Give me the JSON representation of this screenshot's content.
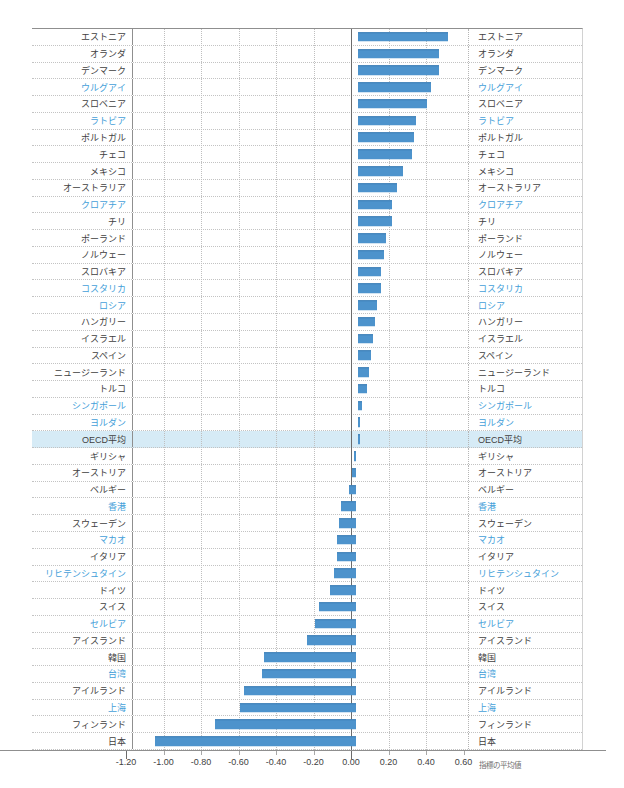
{
  "chart_data": {
    "type": "bar",
    "orientation": "horizontal",
    "xlabel": "指標の平均値",
    "xlim": [
      -1.2,
      0.6
    ],
    "grid": true,
    "x_ticks": [
      "-1.20",
      "-1.00",
      "-0.80",
      "-0.60",
      "-0.40",
      "-0.20",
      "0.00",
      "0.20",
      "0.40",
      "0.60"
    ],
    "x_tick_values": [
      -1.2,
      -1.0,
      -0.8,
      -0.6,
      -0.4,
      -0.2,
      0.0,
      0.2,
      0.4,
      0.6
    ],
    "bar_color": "#4d93cc",
    "member_label_color": "#3f3f3f",
    "partner_label_color": "#44a0d9",
    "highlight_row_color": "#d6ebf6",
    "entries": [
      {
        "label": "エストニア",
        "value": 0.48,
        "partner": false,
        "highlight": false
      },
      {
        "label": "オランダ",
        "value": 0.43,
        "partner": false,
        "highlight": false
      },
      {
        "label": "デンマーク",
        "value": 0.43,
        "partner": false,
        "highlight": false
      },
      {
        "label": "ウルグアイ",
        "value": 0.39,
        "partner": true,
        "highlight": false
      },
      {
        "label": "スロベニア",
        "value": 0.37,
        "partner": false,
        "highlight": false
      },
      {
        "label": "ラトビア",
        "value": 0.31,
        "partner": true,
        "highlight": false
      },
      {
        "label": "ポルトガル",
        "value": 0.3,
        "partner": false,
        "highlight": false
      },
      {
        "label": "チェコ",
        "value": 0.29,
        "partner": false,
        "highlight": false
      },
      {
        "label": "メキシコ",
        "value": 0.24,
        "partner": false,
        "highlight": false
      },
      {
        "label": "オーストラリア",
        "value": 0.21,
        "partner": false,
        "highlight": false
      },
      {
        "label": "クロアチア",
        "value": 0.18,
        "partner": true,
        "highlight": false
      },
      {
        "label": "チリ",
        "value": 0.18,
        "partner": false,
        "highlight": false
      },
      {
        "label": "ポーランド",
        "value": 0.15,
        "partner": false,
        "highlight": false
      },
      {
        "label": "ノルウェー",
        "value": 0.14,
        "partner": false,
        "highlight": false
      },
      {
        "label": "スロバキア",
        "value": 0.12,
        "partner": false,
        "highlight": false
      },
      {
        "label": "コスタリカ",
        "value": 0.12,
        "partner": true,
        "highlight": false
      },
      {
        "label": "ロシア",
        "value": 0.1,
        "partner": true,
        "highlight": false
      },
      {
        "label": "ハンガリー",
        "value": 0.09,
        "partner": false,
        "highlight": false
      },
      {
        "label": "イスラエル",
        "value": 0.08,
        "partner": false,
        "highlight": false
      },
      {
        "label": "スペイン",
        "value": 0.07,
        "partner": false,
        "highlight": false
      },
      {
        "label": "ニュージーランド",
        "value": 0.06,
        "partner": false,
        "highlight": false
      },
      {
        "label": "トルコ",
        "value": 0.05,
        "partner": false,
        "highlight": false
      },
      {
        "label": "シンガポール",
        "value": 0.02,
        "partner": true,
        "highlight": false
      },
      {
        "label": "ヨルダン",
        "value": 0.01,
        "partner": true,
        "highlight": false
      },
      {
        "label": "OECD平均",
        "value": 0.0,
        "partner": false,
        "highlight": true
      },
      {
        "label": "ギリシャ",
        "value": -0.01,
        "partner": false,
        "highlight": false
      },
      {
        "label": "オーストリア",
        "value": -0.02,
        "partner": false,
        "highlight": false
      },
      {
        "label": "ベルギー",
        "value": -0.04,
        "partner": false,
        "highlight": false
      },
      {
        "label": "香港",
        "value": -0.08,
        "partner": true,
        "highlight": false
      },
      {
        "label": "スウェーデン",
        "value": -0.09,
        "partner": false,
        "highlight": false
      },
      {
        "label": "マカオ",
        "value": -0.1,
        "partner": true,
        "highlight": false
      },
      {
        "label": "イタリア",
        "value": -0.1,
        "partner": false,
        "highlight": false
      },
      {
        "label": "リヒテンシュタイン",
        "value": -0.12,
        "partner": true,
        "highlight": false
      },
      {
        "label": "ドイツ",
        "value": -0.14,
        "partner": false,
        "highlight": false
      },
      {
        "label": "スイス",
        "value": -0.2,
        "partner": false,
        "highlight": false
      },
      {
        "label": "セルビア",
        "value": -0.22,
        "partner": true,
        "highlight": false
      },
      {
        "label": "アイスランド",
        "value": -0.26,
        "partner": false,
        "highlight": false
      },
      {
        "label": "韓国",
        "value": -0.49,
        "partner": false,
        "highlight": false
      },
      {
        "label": "台湾",
        "value": -0.5,
        "partner": true,
        "highlight": false
      },
      {
        "label": "アイルランド",
        "value": -0.6,
        "partner": false,
        "highlight": false
      },
      {
        "label": "上海",
        "value": -0.62,
        "partner": true,
        "highlight": false
      },
      {
        "label": "フィンランド",
        "value": -0.75,
        "partner": false,
        "highlight": false
      },
      {
        "label": "日本",
        "value": -1.07,
        "partner": false,
        "highlight": false
      }
    ]
  }
}
